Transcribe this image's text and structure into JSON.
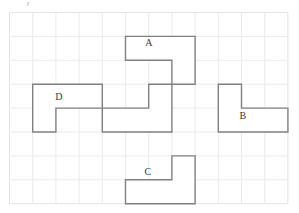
{
  "figure": {
    "type": "shape-rotation-grid",
    "title": ""
  },
  "colors": {
    "background": "#ffffff",
    "grid_line": "#ebebeb",
    "grid_border": "#e4e4e4",
    "shape_stroke": "#808080",
    "shape_fill": "#ffffff",
    "label_text": "#3a3a3a"
  },
  "grid": {
    "origin_x": 9,
    "origin_y": 12,
    "cell_width": 23.2,
    "cell_height": 23.9,
    "columns": 12,
    "rows": 8,
    "line_width": 1,
    "visible": true
  },
  "shapes": [
    {
      "id": "shape-reference",
      "label": "",
      "labeled": false,
      "orientation": "bottom-bar-right-column-up",
      "cell_col": 4,
      "cell_row": 3,
      "cells": [
        [
          0,
          1
        ],
        [
          1,
          1
        ],
        [
          2,
          1
        ],
        [
          2,
          0
        ]
      ],
      "label_x": 0,
      "label_y": 0
    },
    {
      "id": "shape-a",
      "label": "A",
      "labeled": true,
      "orientation": "top-bar-right-column-down",
      "cell_col": 5,
      "cell_row": 1,
      "cells": [
        [
          0,
          0
        ],
        [
          1,
          0
        ],
        [
          2,
          0
        ],
        [
          2,
          1
        ]
      ],
      "label_x": 149,
      "label_y": 43
    },
    {
      "id": "shape-b",
      "label": "B",
      "labeled": true,
      "orientation": "top-left-column-bottom-bar-right",
      "cell_col": 9,
      "cell_row": 3,
      "cells": [
        [
          0,
          0
        ],
        [
          0,
          1
        ],
        [
          1,
          1
        ],
        [
          2,
          1
        ]
      ],
      "label_x": 243,
      "label_y": 116
    },
    {
      "id": "shape-c",
      "label": "C",
      "labeled": true,
      "orientation": "bottom-bar-right-column-up",
      "cell_col": 5,
      "cell_row": 6,
      "cells": [
        [
          0,
          1
        ],
        [
          1,
          1
        ],
        [
          2,
          1
        ],
        [
          2,
          0
        ]
      ],
      "label_x": 148,
      "label_y": 172
    },
    {
      "id": "shape-d",
      "label": "D",
      "labeled": true,
      "orientation": "top-bar-left-column-down",
      "cell_col": 1,
      "cell_row": 3,
      "cells": [
        [
          0,
          0
        ],
        [
          1,
          0
        ],
        [
          2,
          0
        ],
        [
          0,
          1
        ]
      ],
      "label_x": 59,
      "label_y": 97
    }
  ],
  "artifact": {
    "present": true,
    "x": 27,
    "y": 2
  }
}
